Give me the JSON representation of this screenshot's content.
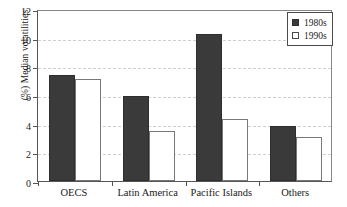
{
  "chart_data": {
    "type": "bar",
    "title": "",
    "xlabel": "",
    "ylabel": "(%) Median volatilities",
    "categories": [
      "OECS",
      "Latin America",
      "Pacific Islands",
      "Others"
    ],
    "series": [
      {
        "name": "1980s",
        "color": "#3a3a3a",
        "values": [
          7.4,
          5.95,
          10.25,
          3.85
        ]
      },
      {
        "name": "1990s",
        "color": "#ffffff",
        "values": [
          7.1,
          3.5,
          4.3,
          3.05
        ]
      }
    ],
    "ylim": [
      0,
      12
    ],
    "yticks": [
      0,
      2,
      4,
      6,
      8,
      10,
      12
    ],
    "ytick_labels": [
      "0",
      "2",
      "4",
      "6",
      "8",
      "10",
      "12"
    ],
    "grid": true,
    "grid_axis": "y",
    "legend_position": "top-right",
    "legend_entries": [
      "1980s",
      "1990s"
    ]
  }
}
